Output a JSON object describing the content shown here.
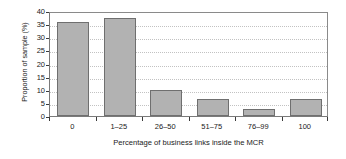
{
  "chart_data": {
    "type": "bar",
    "title": "",
    "subtitle": "",
    "xlabel": "Percentage of business links inside the MCR",
    "ylabel": "Proportion of sample (%)",
    "categories": [
      "0",
      "1–25",
      "26–50",
      "51–75",
      "76–99",
      "100"
    ],
    "values": [
      36,
      37.5,
      10,
      6.5,
      2.5,
      6.5
    ],
    "ylim": [
      0,
      40
    ],
    "ytick_values": [
      0,
      5,
      10,
      15,
      20,
      25,
      30,
      35,
      40
    ],
    "ytick_labels": [
      "0",
      "5",
      "10",
      "15",
      "20",
      "25",
      "30",
      "35",
      "40"
    ],
    "grid": "horizontal-dotted",
    "legend": "none",
    "bar_fill_color": "#b2b2b2",
    "bar_edge_color": "#6f6f6f",
    "axis_color": "#7a7a7a",
    "grid_color": "#c2c2c2",
    "background_color": "#ffffff",
    "annotations": []
  }
}
